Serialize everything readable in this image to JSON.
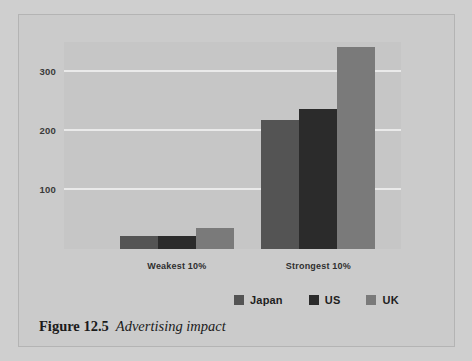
{
  "figure": {
    "caption_number": "Figure 12.5",
    "caption_title": "Advertising impact"
  },
  "legend": {
    "position": "bottom-right",
    "entries": [
      {
        "label": "Japan",
        "color": "#545454",
        "swatch_name": "legend-swatch-japan"
      },
      {
        "label": "US",
        "color": "#2b2b2b",
        "swatch_name": "legend-swatch-us"
      },
      {
        "label": "UK",
        "color": "#7a7a7a",
        "swatch_name": "legend-swatch-uk"
      }
    ]
  },
  "chart_data": {
    "type": "bar",
    "title": "Advertising impact",
    "xlabel": "",
    "ylabel": "",
    "categories": [
      "Weakest 10%",
      "Strongest 10%"
    ],
    "series": [
      {
        "name": "Japan",
        "color": "#545454",
        "values": [
          22,
          218
        ]
      },
      {
        "name": "US",
        "color": "#2b2b2b",
        "values": [
          22,
          237
        ]
      },
      {
        "name": "UK",
        "color": "#7a7a7a",
        "values": [
          35,
          341
        ]
      }
    ],
    "ylim": [
      0,
      350
    ],
    "yticks": [
      100,
      200,
      300
    ],
    "ytick_labels": [
      "100",
      "200",
      "300"
    ],
    "grid": true,
    "grid_axis": "y",
    "grid_color": "#eaeaea",
    "plot_background": "#c6c6c6",
    "legend_position": "bottom-right"
  }
}
